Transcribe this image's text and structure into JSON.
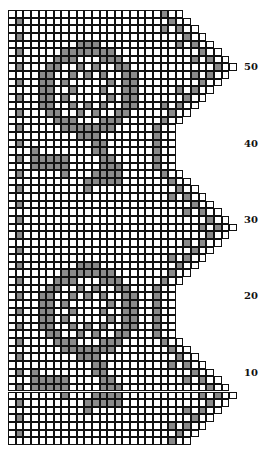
{
  "chart": {
    "rows": 57,
    "base_columns": 22,
    "cell_px": 7.63,
    "colors": {
      "filled": "#8a8a8a",
      "empty": "#ffffff",
      "grid": "#111111"
    },
    "row_labels": [
      {
        "text": "50",
        "row": 50
      },
      {
        "text": "40",
        "row": 40
      },
      {
        "text": "30",
        "row": 30
      },
      {
        "text": "20",
        "row": 20
      },
      {
        "text": "10",
        "row": 10
      }
    ],
    "scallop_peaks_rows": [
      7,
      29,
      50
    ],
    "scallop_peak_extra_columns": 8
  },
  "chart_data": {
    "type": "heatmap",
    "xlabel": "",
    "ylabel": "Row",
    "y_tick_labels": [
      "10",
      "20",
      "30",
      "40",
      "50"
    ],
    "rows": 57,
    "legend": {
      "filled": "block (filled mesh)",
      "empty": "space (open mesh)"
    }
  }
}
